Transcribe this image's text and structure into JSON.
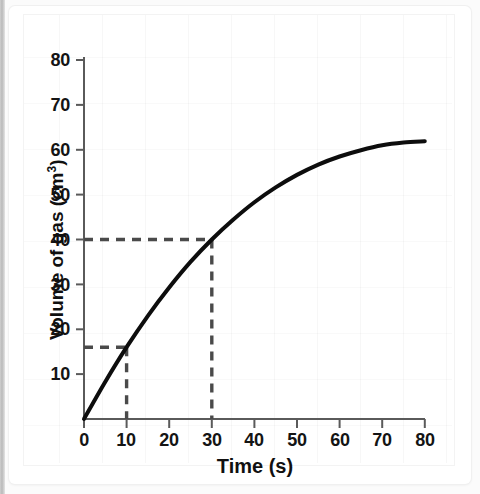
{
  "chart_data": {
    "type": "line",
    "title": "",
    "xlabel": "Time (s)",
    "ylabel": "Volume of gas (cm³)",
    "ylabel_base": "Volume of gas (cm",
    "ylabel_sup": "3",
    "ylabel_tail": ")",
    "xlim": [
      0,
      80
    ],
    "ylim": [
      0,
      80
    ],
    "x_ticks": [
      0,
      10,
      20,
      30,
      40,
      50,
      60,
      70,
      80
    ],
    "x_tick_labels": [
      "0",
      "10",
      "20",
      "30",
      "40",
      "50",
      "60",
      "70",
      "80"
    ],
    "y_ticks": [
      10,
      20,
      30,
      40,
      50,
      60,
      70,
      80
    ],
    "y_tick_labels": [
      "10",
      "20",
      "30",
      "40",
      "50",
      "60",
      "70",
      "80"
    ],
    "grid": "faint",
    "legend": "none",
    "series": [
      {
        "name": "Volume of gas produced",
        "color": "#0d0d0d",
        "line_width": 4,
        "plateau_value": 62,
        "x": [
          0,
          5,
          10,
          15,
          20,
          25,
          30,
          35,
          40,
          45,
          50,
          55,
          60,
          65,
          70,
          75,
          80
        ],
        "y": [
          0,
          8.3,
          16.0,
          23.0,
          29.3,
          35.0,
          40.0,
          44.4,
          48.3,
          51.6,
          54.4,
          56.7,
          58.5,
          59.9,
          61.0,
          61.6,
          61.9
        ]
      }
    ],
    "annotations": [
      {
        "name": "guide-line-40",
        "kind": "dashed-guide",
        "color": "#4a4a4a",
        "x_value": 30,
        "y_value": 40,
        "label": "40 cm³ reached at 30 s"
      },
      {
        "name": "guide-line-16",
        "kind": "dashed-guide",
        "color": "#4a4a4a",
        "x_value": 10,
        "y_value": 16,
        "label": "16 cm³ reached at 10 s"
      }
    ],
    "axis_color": "#5a5a5a",
    "curve_color": "#0d0d0d",
    "guide_color": "#4a4a4a"
  }
}
